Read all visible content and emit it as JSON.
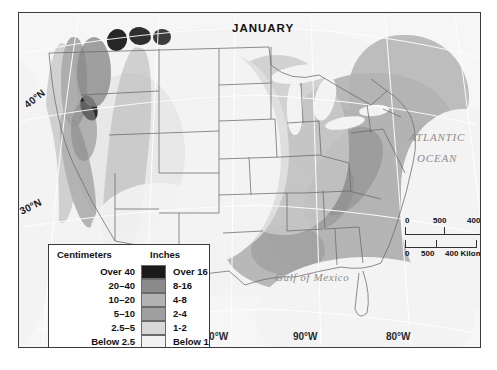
{
  "figure": {
    "title": "JANUARY",
    "type": "thematic precipitation map",
    "region": "United States"
  },
  "labels": {
    "latitude": [
      {
        "text": "40°N",
        "x": 20,
        "y": 88
      },
      {
        "text": "30°N",
        "x": 14,
        "y": 196
      }
    ],
    "longitude": [
      {
        "text": "100°W",
        "x": 196,
        "y": 336
      },
      {
        "text": "90°W",
        "x": 291,
        "y": 336
      },
      {
        "text": "80°W",
        "x": 384,
        "y": 336
      }
    ],
    "seas": [
      {
        "text": "ATLANTIC",
        "x": 408,
        "y": 131,
        "size": 11
      },
      {
        "text": "OCEAN",
        "x": 416,
        "y": 152,
        "size": 11
      },
      {
        "text": "Gulf of Mexico",
        "x": 274,
        "y": 271,
        "size": 11
      }
    ]
  },
  "legend": {
    "header_left": "Centimeters",
    "header_right": "Inches",
    "rows": [
      {
        "cm": "Over 40",
        "in": "Over 16",
        "color": "#1a1a1a"
      },
      {
        "cm": "20–40",
        "in": "8-16",
        "color": "#8a8a8a"
      },
      {
        "cm": "10–20",
        "in": "4-8",
        "color": "#b3b3b3"
      },
      {
        "cm": "5–10",
        "in": "2-4",
        "color": "#9f9f9f"
      },
      {
        "cm": "2.5–5",
        "in": "1-2",
        "color": "#d8d8d8"
      },
      {
        "cm": "Below 2.5",
        "in": "Below 1",
        "color": "#f2f2f2"
      }
    ]
  },
  "scale": {
    "miles": {
      "ticks": [
        "0",
        "500",
        "400 Miles"
      ],
      "unit": "Miles"
    },
    "kilometers": {
      "ticks": [
        "0",
        "500",
        "400 Kilometers"
      ],
      "unit": "Kilometers"
    }
  },
  "colors": {
    "frame": "#3a3a3a",
    "ocean": "#f5f5f5",
    "land_base": "#eeeeee",
    "border_line": "#5a5a5a",
    "graticule": "#ffffff"
  }
}
